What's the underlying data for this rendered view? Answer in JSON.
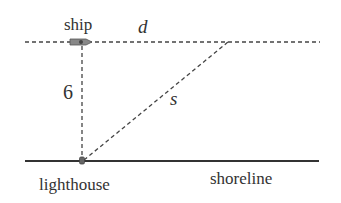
{
  "diagram": {
    "labels": {
      "ship": "ship",
      "distance": "d",
      "height": "6",
      "hypotenuse": "s",
      "lighthouse": "lighthouse",
      "shoreline": "shoreline"
    },
    "colors": {
      "line": "#333333",
      "dashed": "#444444",
      "ship_fill": "#777777"
    }
  }
}
